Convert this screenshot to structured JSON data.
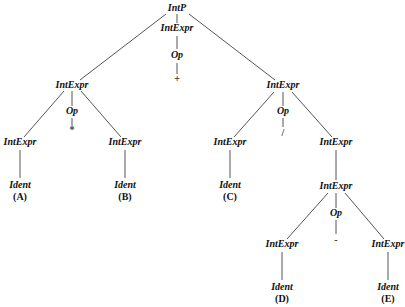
{
  "diagram": {
    "type": "parse-tree",
    "nodes": {
      "root": {
        "label": "IntP",
        "x": 177,
        "y": 9
      },
      "root_expr": {
        "label": "IntExpr",
        "x": 177,
        "y": 29
      },
      "root_op": {
        "label": "Op",
        "x": 177,
        "y": 56
      },
      "root_sym": {
        "label": "+",
        "x": 177,
        "y": 80
      },
      "left": {
        "label": "IntExpr",
        "x": 72,
        "y": 86
      },
      "left_op": {
        "label": "Op",
        "x": 72,
        "y": 112
      },
      "left_sym": {
        "label": "*",
        "x": 72,
        "y": 130
      },
      "left_a": {
        "label": "IntExpr",
        "x": 20,
        "y": 143
      },
      "left_a_ident": {
        "label": "Ident",
        "x": 20,
        "y": 186
      },
      "left_a_name": {
        "label": "(A)",
        "x": 20,
        "y": 198
      },
      "left_b": {
        "label": "IntExpr",
        "x": 125,
        "y": 143
      },
      "left_b_ident": {
        "label": "Ident",
        "x": 125,
        "y": 186
      },
      "left_b_name": {
        "label": "(B)",
        "x": 125,
        "y": 198
      },
      "right": {
        "label": "IntExpr",
        "x": 283,
        "y": 86
      },
      "right_op": {
        "label": "Op",
        "x": 283,
        "y": 112
      },
      "right_sym": {
        "label": "/",
        "x": 283,
        "y": 134
      },
      "right_c": {
        "label": "IntExpr",
        "x": 230,
        "y": 143
      },
      "right_c_ident": {
        "label": "Ident",
        "x": 230,
        "y": 186
      },
      "right_c_name": {
        "label": "(C)",
        "x": 230,
        "y": 198
      },
      "right_r": {
        "label": "IntExpr",
        "x": 336,
        "y": 143
      },
      "right_rr": {
        "label": "IntExpr",
        "x": 336,
        "y": 187
      },
      "right_rr_op": {
        "label": "Op",
        "x": 336,
        "y": 214
      },
      "right_rr_sym": {
        "label": "-",
        "x": 336,
        "y": 241
      },
      "right_d": {
        "label": "IntExpr",
        "x": 282,
        "y": 245
      },
      "right_d_ident": {
        "label": "Ident",
        "x": 282,
        "y": 288
      },
      "right_d_name": {
        "label": "(D)",
        "x": 282,
        "y": 300
      },
      "right_e": {
        "label": "IntExpr",
        "x": 388,
        "y": 245
      },
      "right_e_ident": {
        "label": "Ident",
        "x": 388,
        "y": 288
      },
      "right_e_name": {
        "label": "(E)",
        "x": 388,
        "y": 300
      }
    },
    "colors": {
      "edge": "#555555",
      "text": "#111111",
      "background": "#ffffff"
    }
  }
}
